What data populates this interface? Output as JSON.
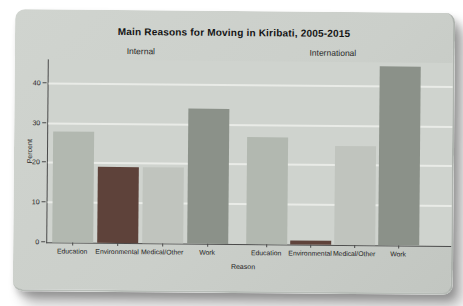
{
  "chart_data": {
    "type": "bar",
    "title": "Main Reasons for Moving in Kiribati, 2005-2015",
    "xlabel": "Reason",
    "ylabel": "Percent",
    "ylim": [
      0,
      46
    ],
    "y_ticks": [
      0,
      10,
      20,
      30,
      40
    ],
    "grid": true,
    "legend": "none",
    "panels": [
      "Internal",
      "International"
    ],
    "categories": [
      "Education",
      "Environmental",
      "Medical/Other",
      "Work"
    ],
    "series": [
      {
        "name": "Internal",
        "values": [
          28,
          19,
          19,
          34
        ]
      },
      {
        "name": "International",
        "values": [
          27,
          1,
          25,
          45
        ]
      }
    ],
    "bar_colors": {
      "Education": "#b2b8b0",
      "Environmental": "#5e423a",
      "Medical/Other": "#c0c4be",
      "Work": "#8b9189"
    },
    "colors": {
      "page_bg": "#ffffff",
      "panel_bg": "#cbcfca",
      "plot_bg": "#cfd3ce",
      "gridline": "#e9ebe7",
      "axis": "#4a4a4a",
      "text": "#222222"
    }
  }
}
